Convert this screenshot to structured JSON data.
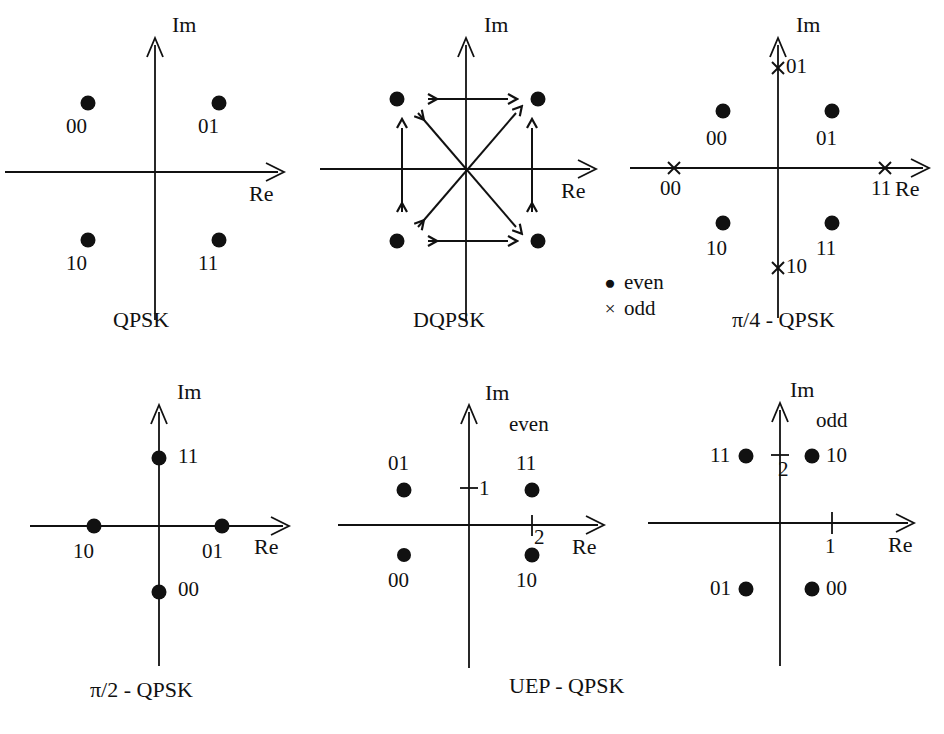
{
  "figure": {
    "background": "#ffffff",
    "ink": "#111111"
  },
  "axis_labels": {
    "real": "Re",
    "imag": "Im"
  },
  "legend": {
    "items": [
      {
        "symbol": "dot",
        "glyph": "●",
        "label": "even"
      },
      {
        "symbol": "cross",
        "glyph": "×",
        "label": "odd"
      }
    ]
  },
  "panels": [
    {
      "id": "qpsk",
      "caption": "QPSK",
      "axis_x": "Re",
      "axis_y": "Im",
      "points": [
        {
          "bits": "00",
          "marker": "dot",
          "x": -1,
          "y": 1
        },
        {
          "bits": "01",
          "marker": "dot",
          "x": 1,
          "y": 1
        },
        {
          "bits": "10",
          "marker": "dot",
          "x": -1,
          "y": -1
        },
        {
          "bits": "11",
          "marker": "dot",
          "x": 1,
          "y": -1
        }
      ],
      "arrows": []
    },
    {
      "id": "dqpsk",
      "caption": "DQPSK",
      "axis_x": "Re",
      "axis_y": "Im",
      "points": [
        {
          "bits": "",
          "marker": "dot",
          "x": -1,
          "y": 1
        },
        {
          "bits": "",
          "marker": "dot",
          "x": 1,
          "y": 1
        },
        {
          "bits": "",
          "marker": "dot",
          "x": -1,
          "y": -1
        },
        {
          "bits": "",
          "marker": "dot",
          "x": 1,
          "y": -1
        }
      ],
      "arrows": [
        {
          "from": [
            -1,
            1
          ],
          "to": [
            1,
            1
          ],
          "style": "double"
        },
        {
          "from": [
            -1,
            -1
          ],
          "to": [
            1,
            -1
          ],
          "style": "double"
        },
        {
          "from": [
            -1,
            -1
          ],
          "to": [
            -1,
            1
          ],
          "style": "double"
        },
        {
          "from": [
            1,
            -1
          ],
          "to": [
            1,
            1
          ],
          "style": "double"
        },
        {
          "from": [
            -1,
            -1
          ],
          "to": [
            1,
            1
          ],
          "style": "double"
        },
        {
          "from": [
            -1,
            1
          ],
          "to": [
            1,
            -1
          ],
          "style": "double"
        }
      ]
    },
    {
      "id": "pi4-qpsk",
      "caption": "π/4 - QPSK",
      "axis_x": "Re",
      "axis_y": "Im",
      "points": [
        {
          "bits": "00",
          "marker": "dot",
          "x": -1,
          "y": 1,
          "label_pos": "below"
        },
        {
          "bits": "01",
          "marker": "dot",
          "x": 1,
          "y": 1,
          "label_pos": "below"
        },
        {
          "bits": "10",
          "marker": "dot",
          "x": -1,
          "y": -1,
          "label_pos": "below"
        },
        {
          "bits": "11",
          "marker": "dot",
          "x": 1,
          "y": -1,
          "label_pos": "below"
        },
        {
          "bits": "01",
          "marker": "cross",
          "x": 0,
          "y": 1.42,
          "label_pos": "right"
        },
        {
          "bits": "10",
          "marker": "cross",
          "x": 0,
          "y": -1.42,
          "label_pos": "right"
        },
        {
          "bits": "00",
          "marker": "cross",
          "x": -1.42,
          "y": 0,
          "label_pos": "below"
        },
        {
          "bits": "11",
          "marker": "cross",
          "x": 1.42,
          "y": 0,
          "label_pos": "below"
        }
      ],
      "arrows": []
    },
    {
      "id": "pi2-qpsk",
      "caption": "π/2 - QPSK",
      "axis_x": "Re",
      "axis_y": "Im",
      "points": [
        {
          "bits": "11",
          "marker": "dot",
          "x": 0,
          "y": 1,
          "label_pos": "right"
        },
        {
          "bits": "00",
          "marker": "dot",
          "x": 0,
          "y": -1,
          "label_pos": "right"
        },
        {
          "bits": "10",
          "marker": "dot",
          "x": -1,
          "y": 0,
          "label_pos": "below"
        },
        {
          "bits": "01",
          "marker": "dot",
          "x": 1,
          "y": 0,
          "label_pos": "below"
        }
      ],
      "arrows": []
    },
    {
      "id": "uep-qpsk-even",
      "caption": "UEP - QPSK",
      "axis_x": "Re",
      "axis_y": "Im",
      "parity": "even",
      "ticks": [
        {
          "axis": "imag",
          "value": "1"
        },
        {
          "axis": "real",
          "value": "2"
        }
      ],
      "points": [
        {
          "bits": "01",
          "marker": "dot",
          "x": -1,
          "y": 1,
          "label_pos": "above"
        },
        {
          "bits": "11",
          "marker": "dot",
          "x": 1,
          "y": 1,
          "label_pos": "above"
        },
        {
          "bits": "00",
          "marker": "dot",
          "x": -1,
          "y": -1,
          "label_pos": "below"
        },
        {
          "bits": "10",
          "marker": "dot",
          "x": 1,
          "y": -1,
          "label_pos": "below"
        }
      ],
      "arrows": []
    },
    {
      "id": "uep-qpsk-odd",
      "caption": "",
      "axis_x": "Re",
      "axis_y": "Im",
      "parity": "odd",
      "ticks": [
        {
          "axis": "imag",
          "value": "2"
        },
        {
          "axis": "real",
          "value": "1"
        }
      ],
      "points": [
        {
          "bits": "11",
          "marker": "dot",
          "x": -1,
          "y": 1,
          "label_pos": "left"
        },
        {
          "bits": "10",
          "marker": "dot",
          "x": 1,
          "y": 1,
          "label_pos": "right"
        },
        {
          "bits": "01",
          "marker": "dot",
          "x": -1,
          "y": -1,
          "label_pos": "left"
        },
        {
          "bits": "00",
          "marker": "dot",
          "x": 1,
          "y": -1,
          "label_pos": "right"
        }
      ],
      "arrows": []
    }
  ],
  "captions": {
    "qpsk": "QPSK",
    "dqpsk": "DQPSK",
    "pi4": "π/4 - QPSK",
    "pi2": "π/2 - QPSK",
    "uep": "UEP - QPSK"
  },
  "parity_tags": {
    "even": "even",
    "odd": "odd"
  },
  "tick_values": {
    "uep_even_imag": "1",
    "uep_even_real": "2",
    "uep_odd_imag": "2",
    "uep_odd_real": "1"
  },
  "bit_labels": {
    "qpsk": [
      "00",
      "01",
      "10",
      "11"
    ],
    "pi4_even": [
      "00",
      "01",
      "10",
      "11"
    ],
    "pi4_odd": [
      "01",
      "10",
      "00",
      "11"
    ],
    "pi2": [
      "11",
      "00",
      "10",
      "01"
    ],
    "uep_even": [
      "01",
      "11",
      "00",
      "10"
    ],
    "uep_odd": [
      "11",
      "10",
      "01",
      "00"
    ]
  }
}
